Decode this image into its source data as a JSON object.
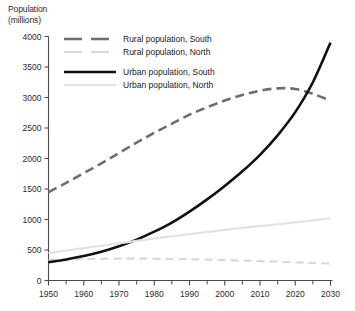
{
  "chart_data": {
    "type": "line",
    "title": "",
    "ylabel": "Population\n(millions)",
    "xlabel": "",
    "xlim": [
      1950,
      2030
    ],
    "ylim": [
      0,
      4000
    ],
    "grid": false,
    "legend_position": "top-left-inside",
    "x_ticks": [
      1950,
      1960,
      1970,
      1980,
      1990,
      2000,
      2010,
      2020,
      2030
    ],
    "x_minor_ticks": [
      1955,
      1965,
      1975,
      1985,
      1995,
      2005,
      2015,
      2025
    ],
    "y_ticks": [
      0,
      500,
      1000,
      1500,
      2000,
      2500,
      3000,
      3500,
      4000
    ],
    "x": [
      1950,
      1955,
      1960,
      1965,
      1970,
      1975,
      1980,
      1985,
      1990,
      1995,
      2000,
      2005,
      2010,
      2015,
      2020,
      2025,
      2030
    ],
    "series": [
      {
        "name": "Rural population, South",
        "color": "#6e6e6e",
        "style": "dashed",
        "width": 2.6,
        "values": [
          1450,
          1600,
          1760,
          1920,
          2090,
          2260,
          2420,
          2570,
          2720,
          2840,
          2950,
          3040,
          3110,
          3150,
          3140,
          3060,
          2950
        ]
      },
      {
        "name": "Rural population, North",
        "color": "#d9d9d9",
        "style": "dashed",
        "width": 2.2,
        "values": [
          340,
          346,
          352,
          356,
          358,
          358,
          356,
          352,
          348,
          342,
          335,
          326,
          318,
          308,
          298,
          288,
          278
        ]
      },
      {
        "name": "Urban population, South",
        "color": "#111111",
        "style": "solid",
        "width": 2.6,
        "values": [
          300,
          345,
          400,
          470,
          560,
          670,
          800,
          950,
          1130,
          1330,
          1550,
          1790,
          2060,
          2380,
          2760,
          3250,
          3900
        ]
      },
      {
        "name": "Urban population, North",
        "color": "#e2e2e2",
        "style": "solid",
        "width": 2.2,
        "values": [
          450,
          490,
          530,
          570,
          610,
          650,
          690,
          725,
          760,
          795,
          830,
          862,
          892,
          922,
          952,
          986,
          1020
        ]
      }
    ],
    "legend_entries": [
      {
        "label": "Rural population, South",
        "color": "#6e6e6e",
        "style": "dashed",
        "width": 2.6
      },
      {
        "label": "Rural population, North",
        "color": "#d9d9d9",
        "style": "dashed",
        "width": 2.2
      },
      {
        "label": "Urban population, South",
        "color": "#111111",
        "style": "solid",
        "width": 2.6
      },
      {
        "label": "Urban population, North",
        "color": "#e2e2e2",
        "style": "solid",
        "width": 2.2
      }
    ],
    "axis_color": "#4a4a4a"
  }
}
